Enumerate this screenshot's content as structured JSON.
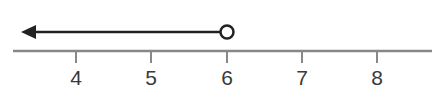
{
  "number_line": {
    "ticks": [
      {
        "value": 4,
        "label": "4",
        "x": 76
      },
      {
        "value": 5,
        "label": "5",
        "x": 151
      },
      {
        "value": 6,
        "label": "6",
        "x": 227
      },
      {
        "value": 7,
        "label": "7",
        "x": 302
      },
      {
        "value": 8,
        "label": "8",
        "x": 377
      }
    ],
    "axis_color": "#888888",
    "ray_color": "#222222"
  },
  "inequality": {
    "description": "x < 6",
    "endpoint": 6,
    "endpoint_type": "open-circle",
    "direction": "left"
  }
}
